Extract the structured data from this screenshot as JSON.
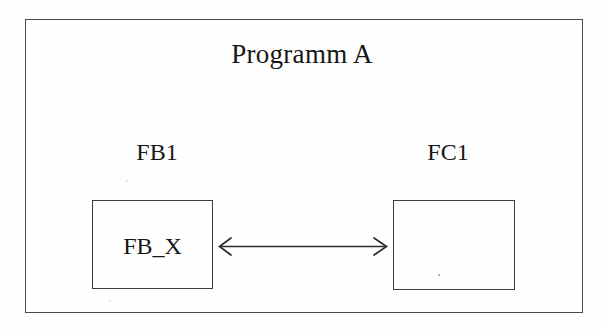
{
  "diagram": {
    "title": "Programm A",
    "blocks": [
      {
        "label": "FB1",
        "box_text": "FB_X"
      },
      {
        "label": "FC1",
        "box_text": ""
      }
    ],
    "connector": {
      "name": "bidirectional-arrow",
      "style": "double-headed",
      "color": "#2e2e2e"
    },
    "colors": {
      "line": "#4a4a4a",
      "text": "#161616",
      "background": "#fefefe"
    }
  }
}
